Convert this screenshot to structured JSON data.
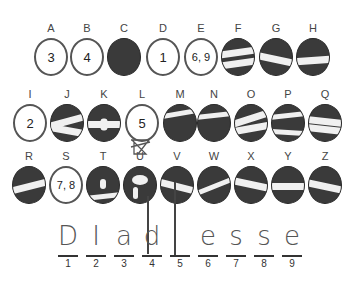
{
  "puzzle": {
    "rows": [
      [
        {
          "letter": "A",
          "type": "white",
          "value": "3"
        },
        {
          "letter": "B",
          "type": "white",
          "value": "4"
        },
        {
          "letter": "C",
          "type": "dark",
          "value": ""
        },
        {
          "letter": "D",
          "type": "white",
          "value": "1"
        },
        {
          "letter": "E",
          "type": "white",
          "value": "6, 9"
        },
        {
          "letter": "F",
          "type": "dark",
          "value": ""
        },
        {
          "letter": "G",
          "type": "dark",
          "value": ""
        },
        {
          "letter": "H",
          "type": "dark",
          "value": ""
        }
      ],
      [
        {
          "letter": "I",
          "type": "white",
          "value": "2"
        },
        {
          "letter": "J",
          "type": "dark",
          "value": ""
        },
        {
          "letter": "K",
          "type": "dark",
          "value": ""
        },
        {
          "letter": "L",
          "type": "white",
          "value": "5"
        },
        {
          "letter": "M",
          "type": "dark",
          "value": ""
        },
        {
          "letter": "N",
          "type": "dark",
          "value": ""
        },
        {
          "letter": "O",
          "type": "dark",
          "value": ""
        },
        {
          "letter": "P",
          "type": "dark",
          "value": ""
        },
        {
          "letter": "Q",
          "type": "dark",
          "value": ""
        }
      ],
      [
        {
          "letter": "R",
          "type": "dark",
          "value": ""
        },
        {
          "letter": "S",
          "type": "white",
          "value": "7, 8"
        },
        {
          "letter": "T",
          "type": "dark",
          "value": ""
        },
        {
          "letter": "U",
          "type": "dark",
          "value": "",
          "crossed_out": true
        },
        {
          "letter": "V",
          "type": "dark",
          "value": ""
        },
        {
          "letter": "W",
          "type": "dark",
          "value": ""
        },
        {
          "letter": "X",
          "type": "dark",
          "value": ""
        },
        {
          "letter": "Y",
          "type": "dark",
          "value": ""
        },
        {
          "letter": "Z",
          "type": "dark",
          "value": ""
        }
      ]
    ]
  },
  "answer": {
    "handwritten": [
      "D",
      "I",
      "a",
      "d",
      "l",
      "e",
      "s",
      "s",
      "e"
    ],
    "indices": [
      "1",
      "2",
      "3",
      "4",
      "5",
      "6",
      "7",
      "8",
      "9"
    ]
  }
}
